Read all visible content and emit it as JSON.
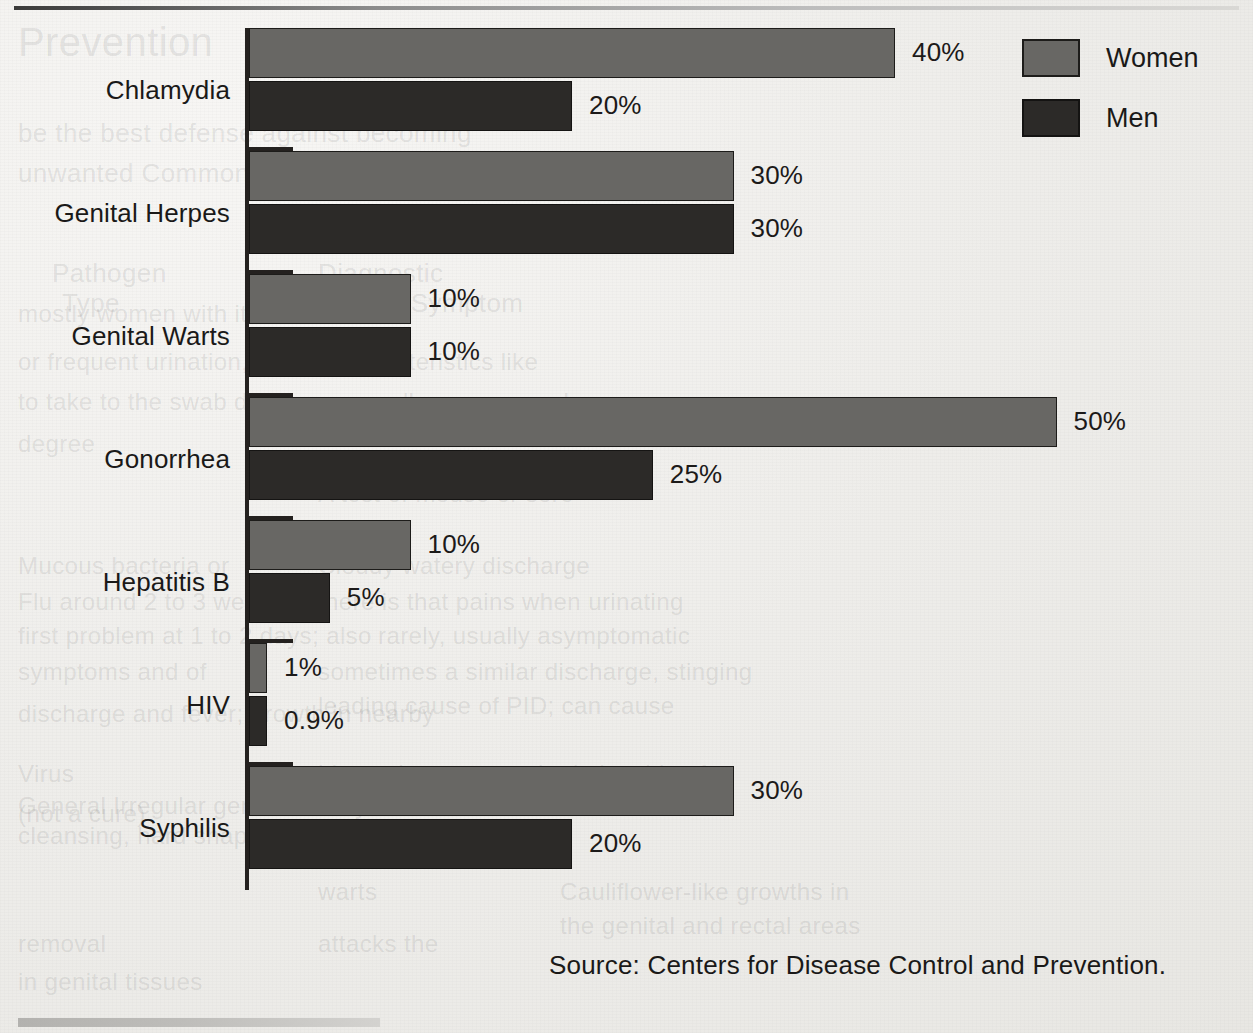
{
  "chart_data": {
    "type": "bar",
    "orientation": "horizontal",
    "title": "",
    "xlabel": "",
    "ylabel": "",
    "xlim": [
      0,
      50
    ],
    "grid": false,
    "legend_position": "top-right",
    "categories": [
      "Chlamydia",
      "Genital Herpes",
      "Genital Warts",
      "Gonorrhea",
      "Hepatitis B",
      "HIV",
      "Syphilis"
    ],
    "series": [
      {
        "name": "Women",
        "color": "#686764",
        "values": [
          40,
          30,
          10,
          50,
          10,
          1,
          30
        ],
        "labels": [
          "40%",
          "30%",
          "10%",
          "50%",
          "10%",
          "1%",
          "30%"
        ]
      },
      {
        "name": "Men",
        "color": "#2c2a28",
        "values": [
          20,
          30,
          10,
          25,
          5,
          0.9,
          20
        ],
        "labels": [
          "20%",
          "30%",
          "10%",
          "25%",
          "5%",
          "0.9%",
          "20%"
        ]
      }
    ],
    "source": "Source:  Centers for Disease Control and Prevention."
  },
  "legend": {
    "items": [
      {
        "label": "Women",
        "color": "#686764"
      },
      {
        "label": "Men",
        "color": "#2c2a28"
      }
    ]
  },
  "footer": {
    "source": "Source:  Centers for Disease Control and Prevention."
  },
  "bleed_through": [
    {
      "text": "Prevention",
      "x": 18,
      "y": 20,
      "size": 40,
      "serif": false
    },
    {
      "text": "be the best defense against becoming",
      "x": 18,
      "y": 118,
      "size": 26,
      "serif": false
    },
    {
      "text": "unwanted Commonly Sexually Transmitted",
      "x": 18,
      "y": 158,
      "size": 26,
      "serif": false
    },
    {
      "text": "Pathogen",
      "x": 52,
      "y": 258,
      "size": 26,
      "serif": false
    },
    {
      "text": "Diagnostic",
      "x": 318,
      "y": 258,
      "size": 26,
      "serif": false
    },
    {
      "text": "Type",
      "x": 62,
      "y": 288,
      "size": 26,
      "serif": false
    },
    {
      "text": "Sign or Symptom",
      "x": 318,
      "y": 288,
      "size": 26,
      "serif": false
    },
    {
      "text": "mostly women with it is uncommon",
      "x": 18,
      "y": 300,
      "size": 24,
      "serif": false
    },
    {
      "text": "or frequent urination, sexual characteristics like",
      "x": 18,
      "y": 348,
      "size": 24,
      "serif": false
    },
    {
      "text": "to take to the swab discharge, a yellow or gray color",
      "x": 18,
      "y": 388,
      "size": 24,
      "serif": false
    },
    {
      "text": "degree",
      "x": 18,
      "y": 430,
      "size": 24,
      "serif": false
    },
    {
      "text": "A test of mouse or sore",
      "x": 318,
      "y": 480,
      "size": 24,
      "serif": false
    },
    {
      "text": "Mucous bacteria or",
      "x": 18,
      "y": 552,
      "size": 24,
      "serif": false
    },
    {
      "text": "Cloudy watery discharge",
      "x": 318,
      "y": 552,
      "size": 24,
      "serif": false
    },
    {
      "text": "Flu around 2 to 3 weeks",
      "x": 18,
      "y": 588,
      "size": 24,
      "serif": false
    },
    {
      "text": "there is that pains when urinating",
      "x": 318,
      "y": 588,
      "size": 24,
      "serif": false
    },
    {
      "text": "first problem at 1 to 2 days; also",
      "x": 18,
      "y": 622,
      "size": 24,
      "serif": false
    },
    {
      "text": "rarely, usually asymptomatic",
      "x": 378,
      "y": 622,
      "size": 24,
      "serif": false
    },
    {
      "text": "symptoms and of",
      "x": 18,
      "y": 658,
      "size": 24,
      "serif": false
    },
    {
      "text": "sometimes a similar discharge, stinging",
      "x": 318,
      "y": 658,
      "size": 24,
      "serif": false
    },
    {
      "text": "leading cause of PID; can cause",
      "x": 318,
      "y": 692,
      "size": 24,
      "serif": false
    },
    {
      "text": "discharge and fever; growth in nearby",
      "x": 18,
      "y": 700,
      "size": 24,
      "serif": false
    },
    {
      "text": "Virus",
      "x": 18,
      "y": 760,
      "size": 24,
      "serif": false
    },
    {
      "text": "history in overturned relationship of",
      "x": 318,
      "y": 760,
      "size": 24,
      "serif": false
    },
    {
      "text": "General Irregular genital history",
      "x": 18,
      "y": 792,
      "size": 24,
      "serif": false
    },
    {
      "text": "areas",
      "x": 378,
      "y": 792,
      "size": 24,
      "serif": false
    },
    {
      "text": "(not a cure)",
      "x": 18,
      "y": 800,
      "size": 24,
      "serif": false
    },
    {
      "text": "cleansing, hard shapes and chance",
      "x": 18,
      "y": 822,
      "size": 24,
      "serif": false
    },
    {
      "text": "Virus",
      "x": 318,
      "y": 830,
      "size": 24,
      "serif": false
    },
    {
      "text": "warts",
      "x": 318,
      "y": 878,
      "size": 24,
      "serif": false
    },
    {
      "text": "Cauliflower-like growths in",
      "x": 560,
      "y": 878,
      "size": 24,
      "serif": false
    },
    {
      "text": "the genital and rectal areas",
      "x": 560,
      "y": 912,
      "size": 24,
      "serif": false
    },
    {
      "text": "removal",
      "x": 18,
      "y": 930,
      "size": 24,
      "serif": false
    },
    {
      "text": "attacks the",
      "x": 318,
      "y": 930,
      "size": 24,
      "serif": false
    },
    {
      "text": "in genital tissues",
      "x": 18,
      "y": 968,
      "size": 24,
      "serif": false
    }
  ]
}
